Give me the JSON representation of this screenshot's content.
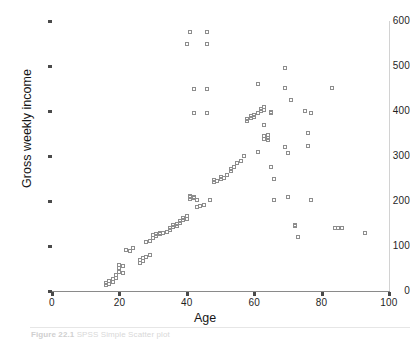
{
  "figure": {
    "caption_label": "Figure 22.1",
    "caption_text": "SPSS Simple Scatter plot"
  },
  "chart_data": {
    "type": "scatter",
    "title": "",
    "xlabel": "Age",
    "ylabel": "Gross weekly income",
    "xlim": [
      0,
      100
    ],
    "ylim": [
      0,
      600
    ],
    "xticks": [
      0,
      20,
      40,
      60,
      80,
      100
    ],
    "yticks": [
      0,
      100,
      200,
      300,
      400,
      500,
      600
    ],
    "grid": false,
    "legend": "none",
    "marker": "open-square",
    "marker_color": "#8d8d8d",
    "series": [
      {
        "name": "Respondents",
        "points": [
          [
            16,
            14
          ],
          [
            16,
            18
          ],
          [
            17,
            16
          ],
          [
            17,
            22
          ],
          [
            18,
            20
          ],
          [
            18,
            27
          ],
          [
            19,
            30
          ],
          [
            19,
            36
          ],
          [
            20,
            42
          ],
          [
            20,
            52
          ],
          [
            20,
            58
          ],
          [
            21,
            55
          ],
          [
            21,
            40
          ],
          [
            22,
            92
          ],
          [
            23,
            90
          ],
          [
            24,
            96
          ],
          [
            26,
            62
          ],
          [
            26,
            70
          ],
          [
            27,
            66
          ],
          [
            27,
            74
          ],
          [
            28,
            76
          ],
          [
            28,
            110
          ],
          [
            29,
            80
          ],
          [
            29,
            112
          ],
          [
            30,
            118
          ],
          [
            30,
            124
          ],
          [
            31,
            122
          ],
          [
            31,
            126
          ],
          [
            32,
            126
          ],
          [
            32,
            130
          ],
          [
            33,
            128
          ],
          [
            34,
            132
          ],
          [
            35,
            136
          ],
          [
            35,
            140
          ],
          [
            36,
            142
          ],
          [
            36,
            146
          ],
          [
            37,
            144
          ],
          [
            37,
            150
          ],
          [
            38,
            152
          ],
          [
            38,
            156
          ],
          [
            39,
            158
          ],
          [
            39,
            162
          ],
          [
            40,
            160
          ],
          [
            40,
            166
          ],
          [
            40,
            550
          ],
          [
            41,
            576
          ],
          [
            41,
            204
          ],
          [
            41,
            208
          ],
          [
            41,
            212
          ],
          [
            42,
            206
          ],
          [
            42,
            210
          ],
          [
            42,
            396
          ],
          [
            42,
            450
          ],
          [
            43,
            186
          ],
          [
            43,
            202
          ],
          [
            44,
            190
          ],
          [
            44,
            188
          ],
          [
            45,
            192
          ],
          [
            46,
            576
          ],
          [
            46,
            550
          ],
          [
            46,
            396
          ],
          [
            46,
            450
          ],
          [
            47,
            202
          ],
          [
            48,
            242
          ],
          [
            48,
            246
          ],
          [
            49,
            244
          ],
          [
            50,
            250
          ],
          [
            50,
            254
          ],
          [
            51,
            252
          ],
          [
            52,
            258
          ],
          [
            53,
            266
          ],
          [
            53,
            272
          ],
          [
            54,
            276
          ],
          [
            55,
            284
          ],
          [
            56,
            290
          ],
          [
            57,
            300
          ],
          [
            58,
            378
          ],
          [
            58,
            382
          ],
          [
            59,
            384
          ],
          [
            59,
            388
          ],
          [
            60,
            386
          ],
          [
            60,
            392
          ],
          [
            61,
            460
          ],
          [
            61,
            396
          ],
          [
            61,
            308
          ],
          [
            62,
            400
          ],
          [
            62,
            404
          ],
          [
            63,
            408
          ],
          [
            63,
            402
          ],
          [
            63,
            370
          ],
          [
            63,
            338
          ],
          [
            63,
            344
          ],
          [
            64,
            346
          ],
          [
            64,
            340
          ],
          [
            64,
            336
          ],
          [
            65,
            396
          ],
          [
            65,
            398
          ],
          [
            65,
            276
          ],
          [
            66,
            248
          ],
          [
            66,
            202
          ],
          [
            69,
            496
          ],
          [
            69,
            452
          ],
          [
            69,
            320
          ],
          [
            70,
            306
          ],
          [
            70,
            208
          ],
          [
            71,
            424
          ],
          [
            72,
            144
          ],
          [
            72,
            146
          ],
          [
            73,
            120
          ],
          [
            75,
            400
          ],
          [
            76,
            352
          ],
          [
            76,
            322
          ],
          [
            77,
            396
          ],
          [
            77,
            202
          ],
          [
            83,
            452
          ],
          [
            84,
            140
          ],
          [
            85,
            140
          ],
          [
            86,
            140
          ],
          [
            93,
            130
          ]
        ]
      }
    ]
  }
}
